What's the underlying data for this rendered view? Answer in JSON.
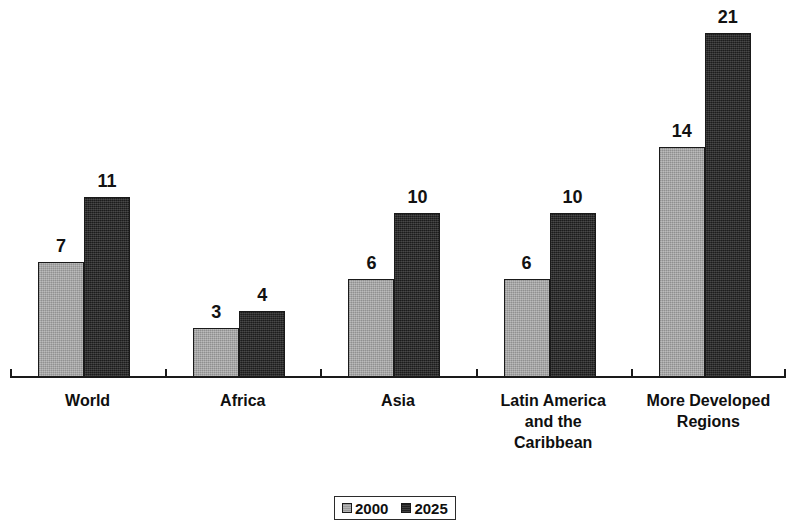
{
  "chart_data": {
    "type": "bar",
    "title": "",
    "subtitle": "",
    "xlabel": "",
    "ylabel": "",
    "categories": [
      "World",
      "Africa",
      "Asia",
      "Latin America and the Caribbean",
      "More Developed Regions"
    ],
    "category_lines": [
      [
        "World"
      ],
      [
        "Africa"
      ],
      [
        "Asia"
      ],
      [
        "Latin America",
        "and the",
        "Caribbean"
      ],
      [
        "More Developed",
        "Regions"
      ]
    ],
    "series": [
      {
        "name": "2000",
        "values": [
          7,
          3,
          6,
          6,
          14
        ],
        "color": "#a3a3a3"
      },
      {
        "name": "2025",
        "values": [
          11,
          4,
          10,
          10,
          21
        ],
        "color": "#242424"
      }
    ],
    "ylim": [
      0,
      22.5
    ],
    "grid": false,
    "legend_position": "bottom-center",
    "data_labels": true
  },
  "legend": {
    "items": [
      {
        "label": "2000",
        "swatch": "legend-swatch-2000"
      },
      {
        "label": "2025",
        "swatch": "legend-swatch-2025"
      }
    ]
  },
  "axis": {
    "baseline": "category-axis",
    "tick_count": 6
  },
  "colors": {
    "series_2000": "#a3a3a3",
    "series_2025": "#242424",
    "axis": "#1a1a1a",
    "text": "#0f0f0f",
    "background": "#ffffff"
  }
}
